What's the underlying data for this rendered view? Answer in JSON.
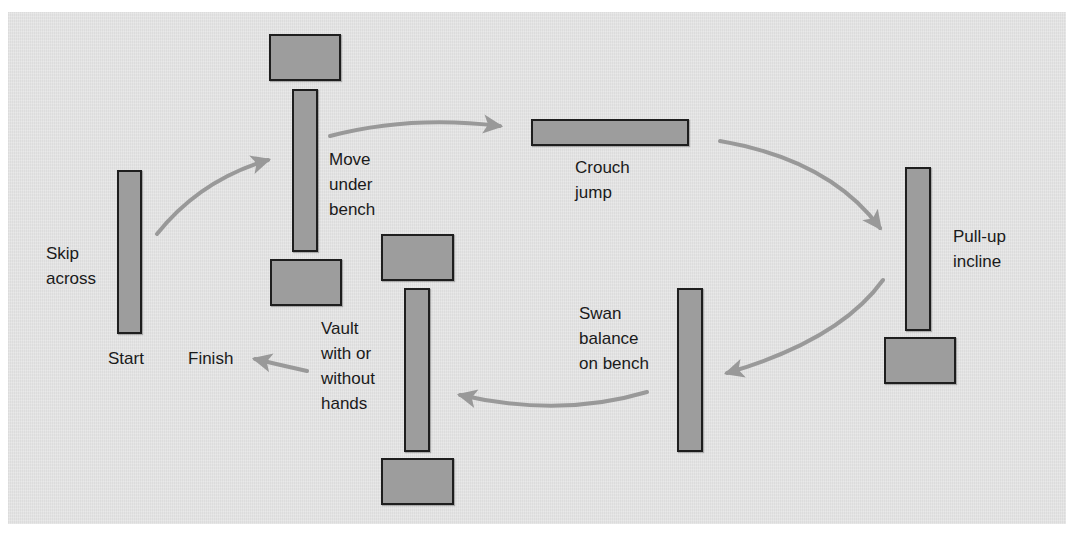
{
  "diagram": {
    "type": "obstacle-course-circuit",
    "colors": {
      "background": "#e4e4e4",
      "equipment_fill": "#9d9d9d",
      "equipment_border": "#1e1e1e",
      "arrow": "#999999",
      "text": "#1a1a1a"
    },
    "stations": [
      {
        "id": "start",
        "lines": [
          "Skip",
          "across"
        ]
      },
      {
        "id": "move-under",
        "lines": [
          "Move",
          "under",
          "bench"
        ]
      },
      {
        "id": "crouch-jump",
        "lines": [
          "Crouch",
          "jump"
        ]
      },
      {
        "id": "pull-up",
        "lines": [
          "Pull-up",
          "incline"
        ]
      },
      {
        "id": "swan-balance",
        "lines": [
          "Swan",
          "balance",
          "on bench"
        ]
      },
      {
        "id": "vault",
        "lines": [
          "Vault",
          "with or",
          "without",
          "hands"
        ]
      }
    ],
    "markers": {
      "start": "Start",
      "finish": "Finish"
    },
    "flow": [
      "Start",
      "Skip across",
      "Move under bench",
      "Crouch jump",
      "Pull-up incline",
      "Swan balance on bench",
      "Vault with or without hands",
      "Finish"
    ]
  }
}
